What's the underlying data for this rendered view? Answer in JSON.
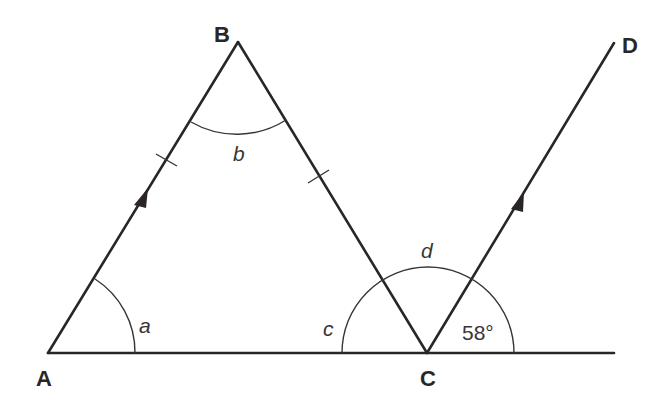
{
  "figure": {
    "type": "geometry-diagram",
    "colors": {
      "ink": "#2b2626",
      "arc": "#3a3535",
      "background": "#ffffff"
    }
  },
  "points": {
    "A": {
      "label": "A",
      "x": 48,
      "y": 353
    },
    "B": {
      "label": "B",
      "x": 238,
      "y": 42
    },
    "C": {
      "label": "C",
      "x": 427,
      "y": 353
    },
    "D": {
      "label": "D",
      "x": 614,
      "y": 43
    }
  },
  "segments": [
    {
      "from": "A",
      "to": "B",
      "marks": "equal-length tick, parallel arrow"
    },
    {
      "from": "B",
      "to": "C",
      "marks": "equal-length tick"
    },
    {
      "from": "C",
      "to": "D",
      "marks": "parallel arrow"
    },
    {
      "from": "A",
      "to": "base-end",
      "note": "straight line through A and C extending to x=614"
    }
  ],
  "angles": {
    "a": {
      "label": "a",
      "vertex": "A"
    },
    "b": {
      "label": "b",
      "vertex": "B"
    },
    "c": {
      "label": "c",
      "vertex": "C",
      "note": "angle ACB on left side"
    },
    "d": {
      "label": "d",
      "vertex": "C",
      "note": "angle BCD"
    },
    "given": {
      "label": "58°",
      "vertex": "C",
      "value_degrees": 58,
      "note": "angle between CD and line extension"
    }
  },
  "markings": {
    "equal_sides": [
      "AB",
      "BC"
    ],
    "parallel_lines": [
      "AB",
      "CD"
    ]
  }
}
